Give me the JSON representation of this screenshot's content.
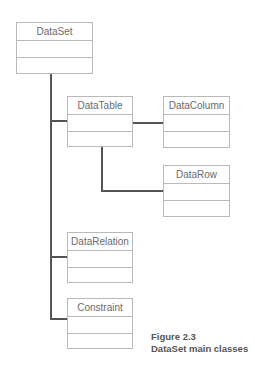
{
  "diagram": {
    "type": "uml-class-diagram",
    "classes": [
      {
        "id": "dataset",
        "name": "DataSet"
      },
      {
        "id": "datatable",
        "name": "DataTable"
      },
      {
        "id": "datacolumn",
        "name": "DataColumn"
      },
      {
        "id": "datarow",
        "name": "DataRow"
      },
      {
        "id": "datarelation",
        "name": "DataRelation"
      },
      {
        "id": "constraint",
        "name": "Constraint"
      }
    ],
    "relationships": [
      {
        "from": "DataSet",
        "to": "DataTable"
      },
      {
        "from": "DataSet",
        "to": "DataRelation"
      },
      {
        "from": "DataSet",
        "to": "Constraint"
      },
      {
        "from": "DataTable",
        "to": "DataColumn"
      },
      {
        "from": "DataTable",
        "to": "DataRow"
      }
    ],
    "colors": {
      "box_border": "#b9b9b9",
      "connector": "#555555",
      "label_text": "#6a6a6a",
      "caption_text": "#555555"
    }
  },
  "caption": {
    "figure_number": "Figure 2.3",
    "title": "DataSet main classes"
  }
}
